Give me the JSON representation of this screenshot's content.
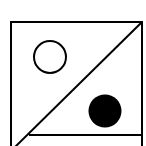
{
  "figure": {
    "colors": {
      "stroke": "#000000",
      "background": "#ffffff",
      "fill_dot": "#000000"
    },
    "shapes": {
      "square": {
        "x": 11,
        "y": 22,
        "width": 131,
        "height": 130
      },
      "diagonal": {
        "x1": 142,
        "y1": 22,
        "x2": 14,
        "y2": 148
      },
      "horizontal_line": {
        "x1": 29,
        "y1": 135,
        "x2": 142,
        "y2": 135
      },
      "open_circle": {
        "cx": 50,
        "cy": 57,
        "r": 16
      },
      "filled_circle": {
        "cx": 105,
        "cy": 111,
        "r": 16.5
      }
    }
  }
}
